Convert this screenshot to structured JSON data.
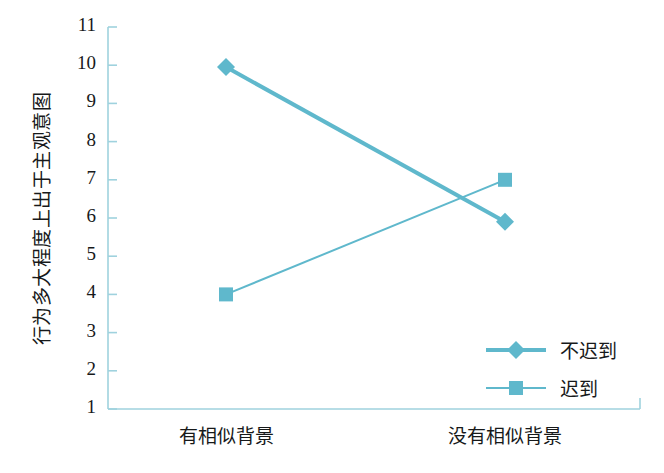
{
  "chart_data": {
    "type": "line",
    "title": "",
    "xlabel": "",
    "ylabel": "行为多大程度上出于主观意图",
    "categories": [
      "有相似背景",
      "没有相似背景"
    ],
    "ylim": [
      1,
      11
    ],
    "ytick_labels": [
      "11",
      "10",
      "9",
      "8",
      "7",
      "6",
      "5",
      "4",
      "3",
      "2",
      "1"
    ],
    "ytick_values": [
      11,
      10,
      9,
      8,
      7,
      6,
      5,
      4,
      3,
      2,
      1
    ],
    "grid": false,
    "legend_position": "bottom-right",
    "series": [
      {
        "name": "不迟到",
        "marker": "diamond",
        "color": "#5fb8cc",
        "line_width": 4,
        "values": [
          9.95,
          5.9
        ]
      },
      {
        "name": "迟到",
        "marker": "square",
        "color": "#5fb8cc",
        "line_width": 2,
        "values": [
          4.0,
          7.0
        ]
      }
    ]
  },
  "axis": {
    "line_color": "#9fd2de",
    "tick_color": "#9fd2de"
  },
  "legend": {
    "entries": [
      {
        "label": "不迟到",
        "marker": "diamond"
      },
      {
        "label": "迟到",
        "marker": "square"
      }
    ]
  }
}
